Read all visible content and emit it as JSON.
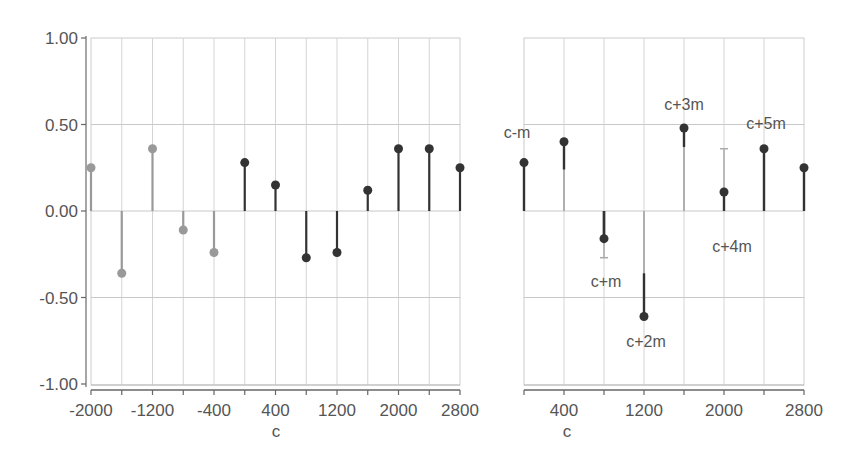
{
  "chart_data": [
    {
      "type": "stem",
      "title": "",
      "xlabel": "c",
      "ylabel": "",
      "xlim": [
        -2000,
        2800
      ],
      "ylim": [
        -1.0,
        1.0
      ],
      "grid": true,
      "x_ticks": [
        -2000,
        -1200,
        -400,
        400,
        1200,
        2000,
        2800
      ],
      "x_tick_labels": [
        "-2000",
        "-1200",
        "-400",
        "400",
        "1200",
        "2000",
        "2800"
      ],
      "y_ticks": [
        1.0,
        0.5,
        0.0,
        -0.5,
        -1.0
      ],
      "y_tick_labels": [
        "1.00",
        "0.50",
        "0.00",
        "-0.50",
        "-1.00"
      ],
      "series": [
        {
          "name": "past (light)",
          "color": "#999999",
          "x": [
            -2000,
            -1600,
            -1200,
            -800,
            -400
          ],
          "values": [
            0.25,
            -0.36,
            0.36,
            -0.11,
            -0.24
          ]
        },
        {
          "name": "current (dark)",
          "color": "#333333",
          "x": [
            0,
            400,
            800,
            1200,
            1600,
            2000,
            2400,
            2800
          ],
          "values": [
            0.28,
            0.15,
            -0.27,
            -0.24,
            0.12,
            0.36,
            0.36,
            0.25
          ]
        }
      ]
    },
    {
      "type": "stem",
      "title": "",
      "xlabel": "c",
      "ylabel": "",
      "xlim": [
        0,
        2800
      ],
      "ylim": [
        -1.0,
        1.0
      ],
      "grid": true,
      "x_ticks": [
        400,
        1200,
        2000,
        2800
      ],
      "x_tick_labels": [
        "400",
        "1200",
        "2000",
        "2800"
      ],
      "series": [
        {
          "name": "values",
          "color": "#333333",
          "x": [
            0,
            400,
            800,
            1200,
            1600,
            2000,
            2400,
            2800
          ],
          "values": [
            0.28,
            0.4,
            -0.16,
            -0.61,
            0.48,
            0.11,
            0.36,
            0.25
          ],
          "light_stem_from": [
            0.0,
            0.0,
            -0.27,
            0.0,
            0.0,
            0.36,
            0.0,
            0.0
          ],
          "dark_stem_from": [
            0.0,
            0.24,
            0.0,
            -0.36,
            0.37,
            0.0,
            0.0,
            0.0
          ]
        }
      ],
      "annotations": [
        {
          "text": "c-m",
          "x": 0,
          "y": 0.28
        },
        {
          "text": "c+m",
          "x": 800,
          "y": -0.16
        },
        {
          "text": "c+2m",
          "x": 1200,
          "y": -0.61
        },
        {
          "text": "c+3m",
          "x": 1600,
          "y": 0.48
        },
        {
          "text": "c+4m",
          "x": 2000,
          "y": 0.11
        },
        {
          "text": "c+5m",
          "x": 2400,
          "y": 0.36
        }
      ]
    }
  ]
}
